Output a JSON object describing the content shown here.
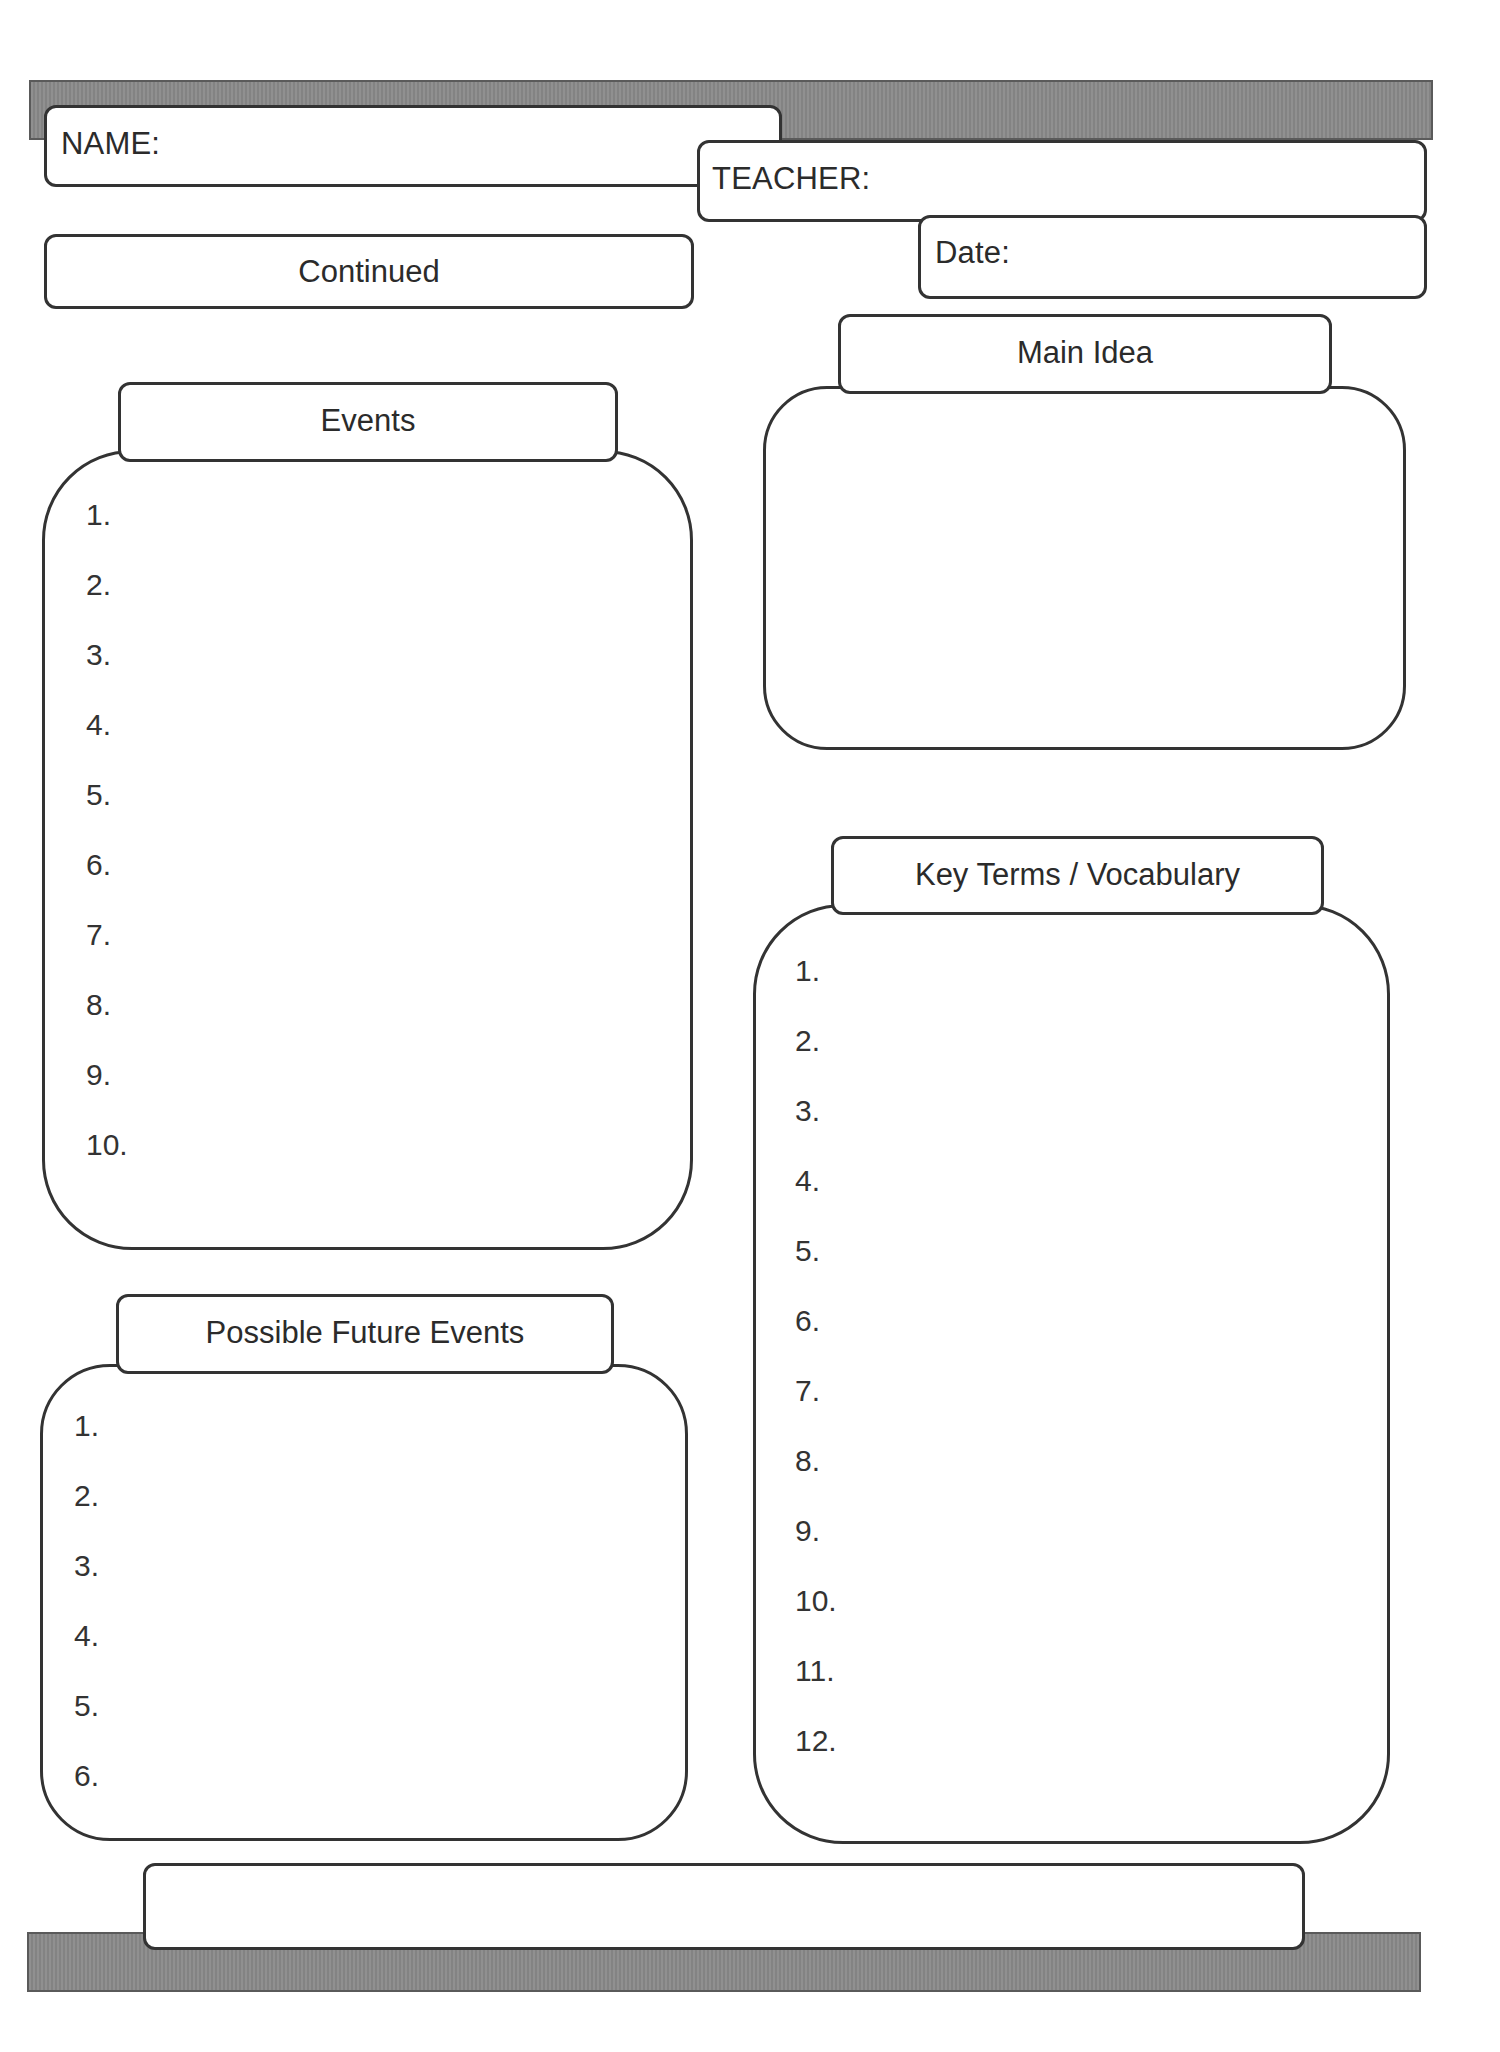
{
  "header": {
    "name_label": "NAME:",
    "teacher_label": "TEACHER:",
    "date_label": "Date:",
    "continued_label": "Continued",
    "bar_color": "#8a8a8a"
  },
  "sections": {
    "events": {
      "title": "Events",
      "items": [
        "1.",
        "2.",
        "3.",
        "4.",
        "5.",
        "6.",
        "7.",
        "8.",
        "9.",
        "10."
      ]
    },
    "main_idea": {
      "title": "Main Idea"
    },
    "key_terms": {
      "title": "Key Terms / Vocabulary",
      "items": [
        "1.",
        "2.",
        "3.",
        "4.",
        "5.",
        "6.",
        "7.",
        "8.",
        "9.",
        "10.",
        "11.",
        "12."
      ]
    },
    "possible_future_events": {
      "title": "Possible Future Events",
      "items": [
        "1.",
        "2.",
        "3.",
        "4.",
        "5.",
        "6."
      ]
    }
  },
  "footer": {
    "box_text": ""
  }
}
